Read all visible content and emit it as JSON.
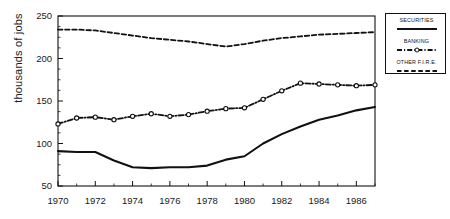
{
  "chart_data": {
    "type": "line",
    "title": "",
    "xlabel": "",
    "ylabel": "thousands of jobs",
    "xlim": [
      1970,
      1987
    ],
    "ylim": [
      50,
      250
    ],
    "ytick_labels": [
      "50",
      "100",
      "150",
      "200",
      "250"
    ],
    "yticks": [
      50,
      100,
      150,
      200,
      250
    ],
    "xtick_labels": [
      "1970",
      "1972",
      "1974",
      "1976",
      "1978",
      "1980",
      "1982",
      "1984",
      "1986"
    ],
    "xticks": [
      1970,
      1972,
      1974,
      1976,
      1978,
      1980,
      1982,
      1984,
      1986
    ],
    "minor_xticks": [
      1971,
      1973,
      1975,
      1977,
      1979,
      1981,
      1983,
      1985,
      1987
    ],
    "grid": false,
    "legend_position": "outside-right-top",
    "x": [
      1970,
      1971,
      1972,
      1973,
      1974,
      1975,
      1976,
      1977,
      1978,
      1979,
      1980,
      1981,
      1982,
      1983,
      1984,
      1985,
      1986,
      1987
    ],
    "series": [
      {
        "name": "SECURITIES",
        "style": "solid-thick",
        "marker": "none",
        "color": "#111111",
        "values": [
          91,
          90,
          90,
          80,
          72,
          71,
          72,
          72,
          74,
          81,
          85,
          100,
          111,
          120,
          128,
          133,
          139,
          143
        ]
      },
      {
        "name": "BANKING",
        "style": "dash-dot",
        "marker": "circle",
        "color": "#111111",
        "values": [
          123,
          130,
          131,
          128,
          132,
          135,
          132,
          134,
          138,
          141,
          142,
          152,
          162,
          171,
          170,
          169,
          168,
          169
        ]
      },
      {
        "name": "OTHER F.I.R.E.",
        "style": "dashed",
        "marker": "none",
        "color": "#111111",
        "values": [
          234,
          234,
          233,
          230,
          227,
          224,
          222,
          220,
          217,
          214,
          217,
          221,
          224,
          226,
          228,
          229,
          230,
          231
        ]
      }
    ]
  },
  "legend": {
    "items": [
      {
        "label": "SECURITIES",
        "swatch": "solid-thick-line-swatch"
      },
      {
        "label": "BANKING",
        "swatch": "dash-dot-circle-line-swatch"
      },
      {
        "label": "OTHER F.I.R.E.",
        "swatch": "dashed-line-swatch"
      }
    ]
  },
  "axes": {
    "y_axis_title": "thousands of jobs"
  },
  "colors": {
    "ink": "#111111",
    "background": "#ffffff"
  }
}
